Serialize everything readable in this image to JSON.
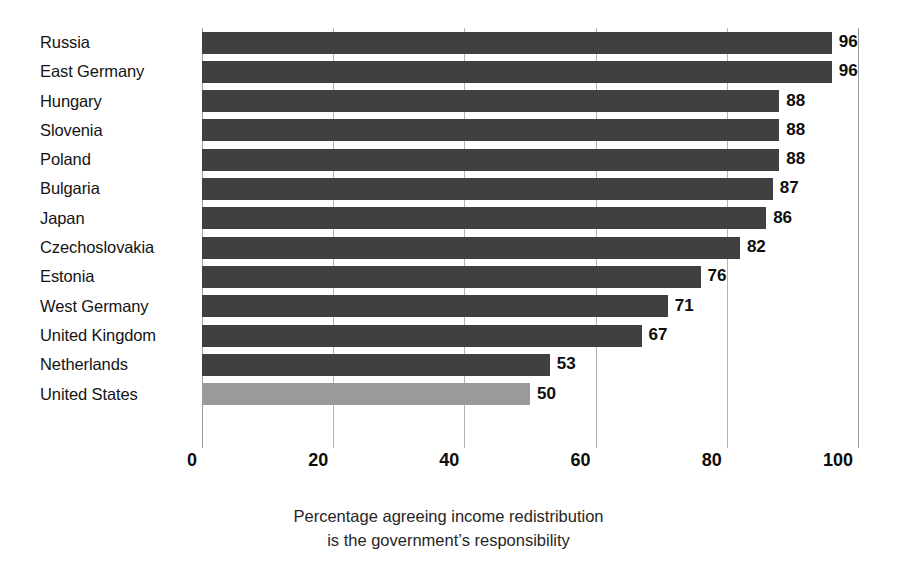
{
  "chart_data": {
    "type": "bar",
    "orientation": "horizontal",
    "title": "",
    "subtitle": "",
    "xlabel": "Percentage agreeing income redistribution is the government’s responsibility",
    "ylabel": "",
    "xlim": [
      0,
      100
    ],
    "xticks": [
      0,
      20,
      40,
      60,
      80,
      100
    ],
    "xtick_labels": [
      "0",
      "20",
      "40",
      "60",
      "80",
      "100"
    ],
    "grid": "vertical",
    "legend": "none",
    "show_value_labels": true,
    "categories": [
      "Russia",
      "East Germany",
      "Hungary",
      "Slovenia",
      "Poland",
      "Bulgaria",
      "Japan",
      "Czechoslovakia",
      "Estonia",
      "West Germany",
      "United Kingdom",
      "Netherlands",
      "United States"
    ],
    "values": [
      96,
      96,
      88,
      88,
      88,
      87,
      86,
      82,
      76,
      71,
      67,
      53,
      50
    ],
    "bars": [
      {
        "label": "Russia",
        "value": 96,
        "value_text": "96",
        "highlight": false
      },
      {
        "label": "East Germany",
        "value": 96,
        "value_text": "96",
        "highlight": false
      },
      {
        "label": "Hungary",
        "value": 88,
        "value_text": "88",
        "highlight": false
      },
      {
        "label": "Slovenia",
        "value": 88,
        "value_text": "88",
        "highlight": false
      },
      {
        "label": "Poland",
        "value": 88,
        "value_text": "88",
        "highlight": false
      },
      {
        "label": "Bulgaria",
        "value": 87,
        "value_text": "87",
        "highlight": false
      },
      {
        "label": "Japan",
        "value": 86,
        "value_text": "86",
        "highlight": false
      },
      {
        "label": "Czechoslovakia",
        "value": 82,
        "value_text": "82",
        "highlight": false
      },
      {
        "label": "Estonia",
        "value": 76,
        "value_text": "76",
        "highlight": false
      },
      {
        "label": "West Germany",
        "value": 71,
        "value_text": "71",
        "highlight": false
      },
      {
        "label": "United Kingdom",
        "value": 67,
        "value_text": "67",
        "highlight": false
      },
      {
        "label": "Netherlands",
        "value": 53,
        "value_text": "53",
        "highlight": false
      },
      {
        "label": "United States",
        "value": 50,
        "value_text": "50",
        "highlight": true
      }
    ],
    "caption_lines": [
      "Percentage agreeing income redistribution",
      "is the government’s responsibility"
    ],
    "colors": {
      "bar": "#404040",
      "bar_highlight": "#9a9a9a",
      "gridline": "#b4b4b4",
      "axis": "#9c9c9c",
      "text": "#141414",
      "background": "#ffffff"
    }
  }
}
